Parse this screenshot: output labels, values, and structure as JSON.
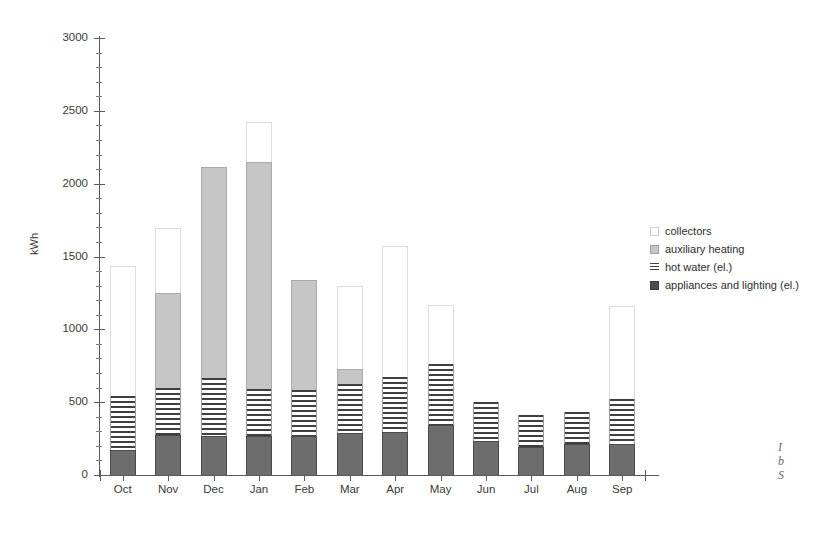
{
  "axes": {
    "ylabel": "kWh",
    "yticks": [
      0,
      500,
      1000,
      1500,
      2000,
      2500,
      3000
    ],
    "ylim": [
      0,
      3000
    ]
  },
  "legend": {
    "position": "right",
    "items": [
      {
        "label": "collectors",
        "icon": "collectors-swatch",
        "color": "#ffffff"
      },
      {
        "label": "auxiliary heating",
        "icon": "aux-heating-swatch",
        "color": "#c6c6c6"
      },
      {
        "label": "hot water (el.)",
        "icon": "hot-water-swatch",
        "color": "#3f3f3f"
      },
      {
        "label": "appliances and lighting (el.)",
        "icon": "appliances-swatch",
        "color": "#4d4d4d"
      }
    ]
  },
  "caption": {
    "line1": "I",
    "line2": "b",
    "line3": "S"
  },
  "chart_data": {
    "type": "bar",
    "stacked": true,
    "title": "",
    "xlabel": "",
    "ylabel": "kWh",
    "ylim": [
      0,
      3000
    ],
    "yticks": [
      0,
      500,
      1000,
      1500,
      2000,
      2500,
      3000
    ],
    "grid": false,
    "legend_position": "right",
    "categories": [
      "Oct",
      "Nov",
      "Dec",
      "Jan",
      "Feb",
      "Mar",
      "Apr",
      "May",
      "Jun",
      "Jul",
      "Aug",
      "Sep"
    ],
    "series": [
      {
        "name": "appliances and lighting (el.)",
        "color": "#6d6d6d",
        "values": [
          175,
          275,
          265,
          265,
          265,
          290,
          295,
          340,
          235,
          190,
          215,
          215
        ]
      },
      {
        "name": "hot water (el.)",
        "color": "#3f3f3f",
        "values": [
          370,
          325,
          400,
          325,
          320,
          335,
          375,
          425,
          265,
          225,
          215,
          305
        ]
      },
      {
        "name": "auxiliary heating",
        "color": "#c6c6c6",
        "values": [
          0,
          650,
          1450,
          1560,
          755,
          100,
          0,
          0,
          0,
          0,
          0,
          0
        ]
      },
      {
        "name": "collectors",
        "color": "#ffffff",
        "values": [
          890,
          445,
          0,
          275,
          0,
          570,
          900,
          400,
          0,
          0,
          0,
          640
        ]
      }
    ],
    "totals": [
      1435,
      1695,
      2115,
      2425,
      1340,
      1295,
      1570,
      1165,
      500,
      415,
      430,
      1160
    ]
  }
}
